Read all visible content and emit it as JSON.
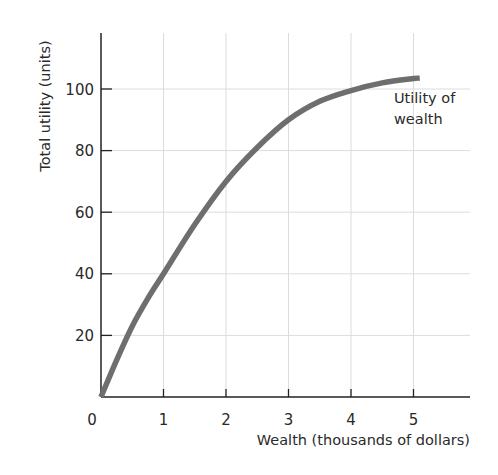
{
  "chart_data": {
    "type": "line",
    "title": "",
    "xlabel": "Wealth (thousands of dollars)",
    "ylabel": "Total utility (units)",
    "xlim": [
      0,
      5.9
    ],
    "ylim": [
      0,
      117
    ],
    "x_ticks": [
      1,
      2,
      3,
      4,
      5
    ],
    "y_ticks": [
      20,
      40,
      60,
      80,
      100
    ],
    "origin_label": "0",
    "grid": true,
    "legend": null,
    "series": [
      {
        "name": "Utility of wealth",
        "x": [
          0,
          0.25,
          0.5,
          0.75,
          1,
          1.5,
          2,
          2.5,
          3,
          3.5,
          4,
          4.5,
          5,
          5.1
        ],
        "values": [
          0,
          12,
          23,
          32,
          40,
          56,
          70,
          81,
          90,
          96,
          99.5,
          102,
          103.4,
          103.5
        ]
      }
    ],
    "annotations": [
      {
        "text_lines": [
          "Utility of",
          "wealth"
        ],
        "x": 4.45,
        "y": 96
      }
    ]
  },
  "colors": {
    "curve": "#6e6e6e",
    "axis": "#222222",
    "grid": "#dcdcdc"
  }
}
